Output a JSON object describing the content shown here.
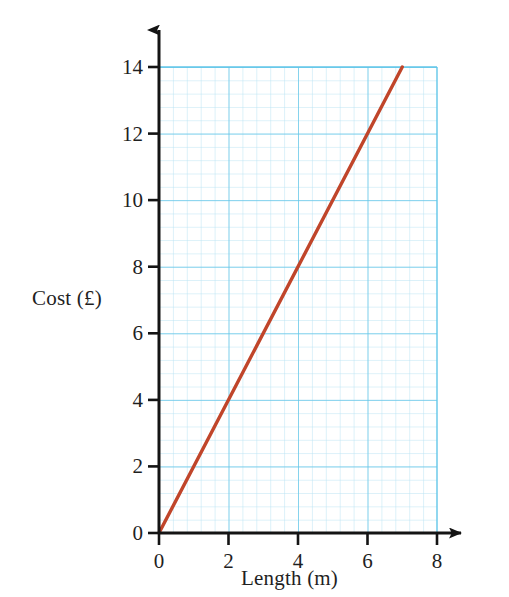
{
  "chart_data": {
    "type": "line",
    "title": "",
    "xlabel": "Length (m)",
    "ylabel": "Cost (£)",
    "xlim": [
      0,
      8
    ],
    "ylim": [
      0,
      14
    ],
    "xticks": [
      0,
      2,
      4,
      6,
      8
    ],
    "yticks": [
      0,
      2,
      4,
      6,
      8,
      10,
      12,
      14
    ],
    "xtick_labels": [
      "0",
      "2",
      "4",
      "6",
      "8"
    ],
    "ytick_labels": [
      "0",
      "2",
      "4",
      "6",
      "8",
      "10",
      "12",
      "14"
    ],
    "grid": true,
    "grid_major_step_x": 2,
    "grid_major_step_y": 2,
    "grid_minor_step_x": 0.4,
    "grid_minor_step_y": 0.4,
    "legend": null,
    "series": [
      {
        "name": "Cost vs Length",
        "color": "#c0452a",
        "slope": 2,
        "intercept": 0,
        "x": [
          0,
          1,
          2,
          3,
          4,
          5,
          6,
          7
        ],
        "values": [
          0,
          2,
          4,
          6,
          8,
          10,
          12,
          14
        ],
        "points": [
          [
            0,
            0
          ],
          [
            7,
            14
          ]
        ]
      }
    ],
    "colors": {
      "line": "#c0452a",
      "grid_minor": "#b8e2f2",
      "grid_major": "#67c7e8",
      "axis": "#1a1a1a",
      "background": "#ffffff"
    }
  },
  "axes": {
    "x_axis_name": "Length axis",
    "y_axis_name": "Cost axis",
    "arrowheads": true
  }
}
